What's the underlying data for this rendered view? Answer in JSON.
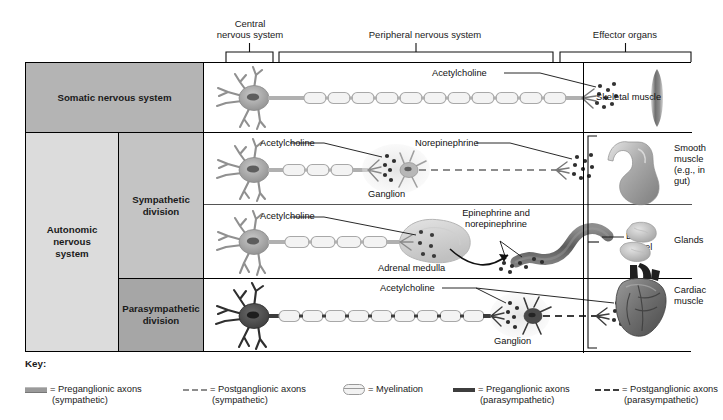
{
  "header": {
    "cns": "Central\nnervous system",
    "pns": "Peripheral nervous system",
    "effector": "Effector organs"
  },
  "rows": {
    "somatic_label": "Somatic nervous system",
    "autonomic_label": "Autonomic\nnervous\nsystem",
    "sympathetic_label": "Sympathetic\ndivision",
    "parasympathetic_label": "Parasympathetic\ndivision"
  },
  "somatic": {
    "neurotransmitter": "Acetylcholine",
    "organ": "Skeletal muscle"
  },
  "sympathetic_ganglionic": {
    "pre_nt": "Acetylcholine",
    "ganglion": "Ganglion",
    "post_nt": "Norepinephrine"
  },
  "sympathetic_adrenal": {
    "pre_nt": "Acetylcholine",
    "gland": "Adrenal medulla",
    "hormones": "Epinephrine and\nnorepinephrine",
    "vessel": "Blood\nvessel"
  },
  "parasympathetic": {
    "pre_nt": "Acetylcholine",
    "ganglion": "Ganglion"
  },
  "effectors": [
    {
      "name": "Smooth\nmuscle\n(e.g., in\ngut)",
      "icon": "stomach-icon"
    },
    {
      "name": "Glands",
      "icon": "glands-icon"
    },
    {
      "name": "Cardiac\nmuscle",
      "icon": "heart-icon"
    }
  ],
  "key": {
    "title": "Key:",
    "items": [
      {
        "main": "= Preganglionic axons",
        "sub": "(sympathetic)",
        "swatch": "solid-gray-thick"
      },
      {
        "main": "= Postganglionic axons",
        "sub": "(sympathetic)",
        "swatch": "dashed-gray"
      },
      {
        "main": "= Myelination",
        "sub": "",
        "swatch": "myelin-segment"
      },
      {
        "main": "= Preganglionic axons",
        "sub": "(parasympathetic)",
        "swatch": "solid-dark-thick"
      },
      {
        "main": "= Postganglionic axons",
        "sub": "(parasympathetic)",
        "swatch": "dashed-dark"
      }
    ]
  },
  "colors": {
    "somatic_band": "#b4b4b4",
    "autonomic_band": "#dcdcdc",
    "sympathetic_band": "#c4c4c4",
    "parasympathetic_band": "#a6a6a6",
    "border": "#000000",
    "neuron_light": "#b6b6b6",
    "neuron_dark": "#4a4a4a"
  }
}
